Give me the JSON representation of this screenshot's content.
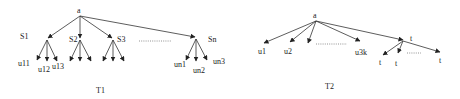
{
  "trees": [
    {
      "id": "T1",
      "caption": "T1",
      "root": "a",
      "subroots": [
        {
          "label": "S1",
          "children": [
            "u11",
            "u12",
            "u13"
          ]
        },
        {
          "label": "S2",
          "children": [
            "",
            "",
            ""
          ]
        },
        {
          "label": "S3",
          "children": [
            "",
            "",
            ""
          ]
        },
        {
          "label": "Sn",
          "children": [
            "un1",
            "un2",
            "un3"
          ]
        }
      ],
      "ellipsis": "........."
    },
    {
      "id": "T2",
      "caption": "T2",
      "root": "a",
      "leaves": [
        "u1",
        "u2",
        "",
        "u3k"
      ],
      "t_node": {
        "label": "t",
        "children": [
          "t",
          "t",
          "t"
        ]
      },
      "ellipsis": "........."
    }
  ]
}
